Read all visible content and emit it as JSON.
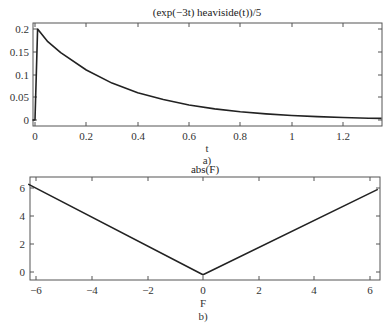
{
  "chart_data": [
    {
      "type": "line",
      "title": "(exp(-3t) heaviside(t))/5",
      "xlabel": "t",
      "ylabel": "",
      "caption": "a)",
      "xlim": [
        -0.01,
        1.35
      ],
      "ylim": [
        -0.013,
        0.213
      ],
      "xticks": [
        "0",
        "0.2",
        "0.4",
        "0.6",
        "0.8",
        "1",
        "1.2"
      ],
      "yticks": [
        "0",
        "0.05",
        "0.1",
        "0.15",
        "0.2"
      ],
      "grid": false,
      "series": [
        {
          "name": "(exp(-3t) heaviside(t))/5",
          "x": [
            -0.01,
            0,
            0.01,
            0.05,
            0.1,
            0.2,
            0.3,
            0.4,
            0.5,
            0.6,
            0.7,
            0.8,
            0.9,
            1.0,
            1.1,
            1.2,
            1.3,
            1.35
          ],
          "y": [
            0,
            0,
            0.2,
            0.172,
            0.148,
            0.11,
            0.081,
            0.06,
            0.045,
            0.033,
            0.0245,
            0.018,
            0.0134,
            0.01,
            0.0074,
            0.0055,
            0.004,
            0.0035
          ]
        }
      ]
    },
    {
      "type": "line",
      "title": "abs(F)",
      "xlabel": "F",
      "ylabel": "",
      "caption": "b)",
      "xlim": [
        -6.28,
        6.28
      ],
      "ylim": [
        -0.5,
        6.8
      ],
      "xticks": [
        "-6",
        "-4",
        "-2",
        "0",
        "2",
        "4",
        "6"
      ],
      "yticks": [
        "0",
        "2",
        "4",
        "6"
      ],
      "grid": false,
      "series": [
        {
          "name": "abs(F)",
          "x": [
            -6.28,
            0,
            6.28
          ],
          "y": [
            6.28,
            -0.2,
            5.9
          ]
        }
      ]
    }
  ]
}
